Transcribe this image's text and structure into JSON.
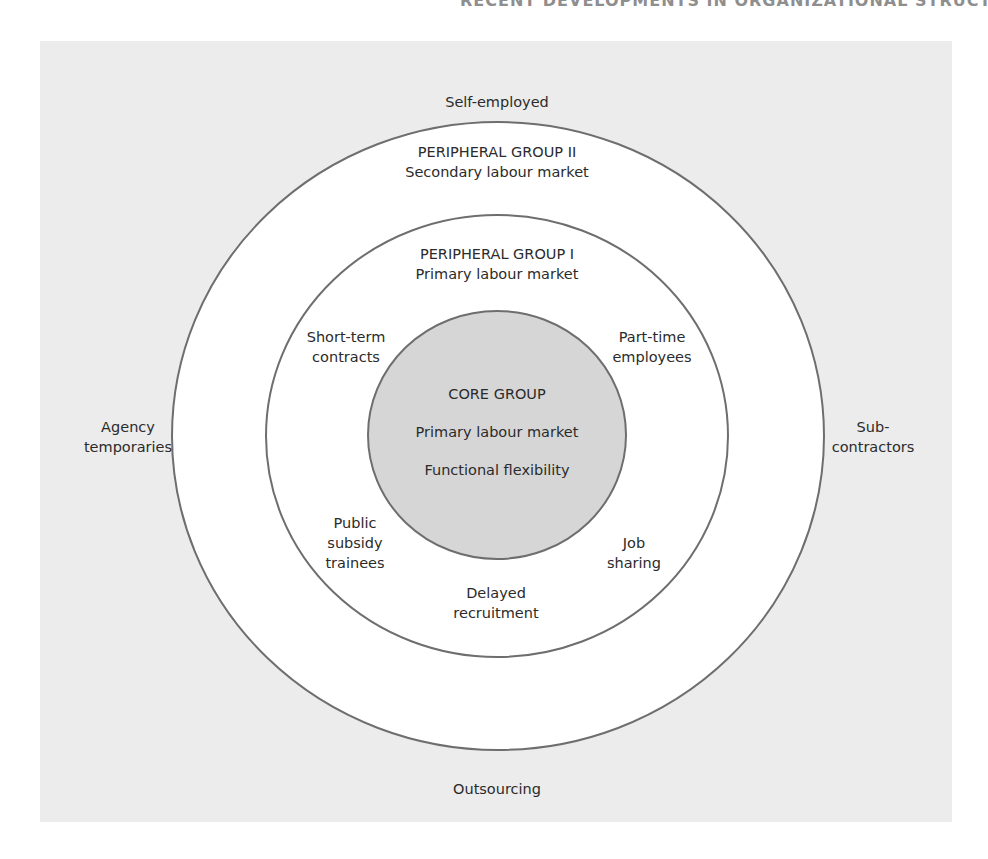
{
  "page": {
    "running_head": "RECENT DEVELOPMENTS IN ORGANIZATIONAL STRUCTURE 329"
  },
  "diagram": {
    "type": "concentric-rings",
    "colors": {
      "panel_background": "#ececec",
      "ring_fill": "#ffffff",
      "core_fill": "#d6d6d6",
      "ring_stroke": "#6e6e6e"
    },
    "outside_labels": {
      "top": "Self-employed",
      "left": [
        "Agency",
        "temporaries"
      ],
      "right": [
        "Sub-",
        "contractors"
      ],
      "bottom": "Outsourcing"
    },
    "outer_ring": {
      "title": "PERIPHERAL GROUP II",
      "subtitle": "Secondary labour market"
    },
    "middle_ring": {
      "title": "PERIPHERAL GROUP I",
      "subtitle": "Primary labour market",
      "items": {
        "top_left": [
          "Short-term",
          "contracts"
        ],
        "top_right": [
          "Part-time",
          "employees"
        ],
        "bottom_left": [
          "Public",
          "subsidy",
          "trainees"
        ],
        "bottom_right": [
          "Job",
          "sharing"
        ],
        "bottom": [
          "Delayed",
          "recruitment"
        ]
      }
    },
    "core": {
      "title": "CORE GROUP",
      "line2": "Primary labour market",
      "line3": "Functional flexibility"
    }
  }
}
